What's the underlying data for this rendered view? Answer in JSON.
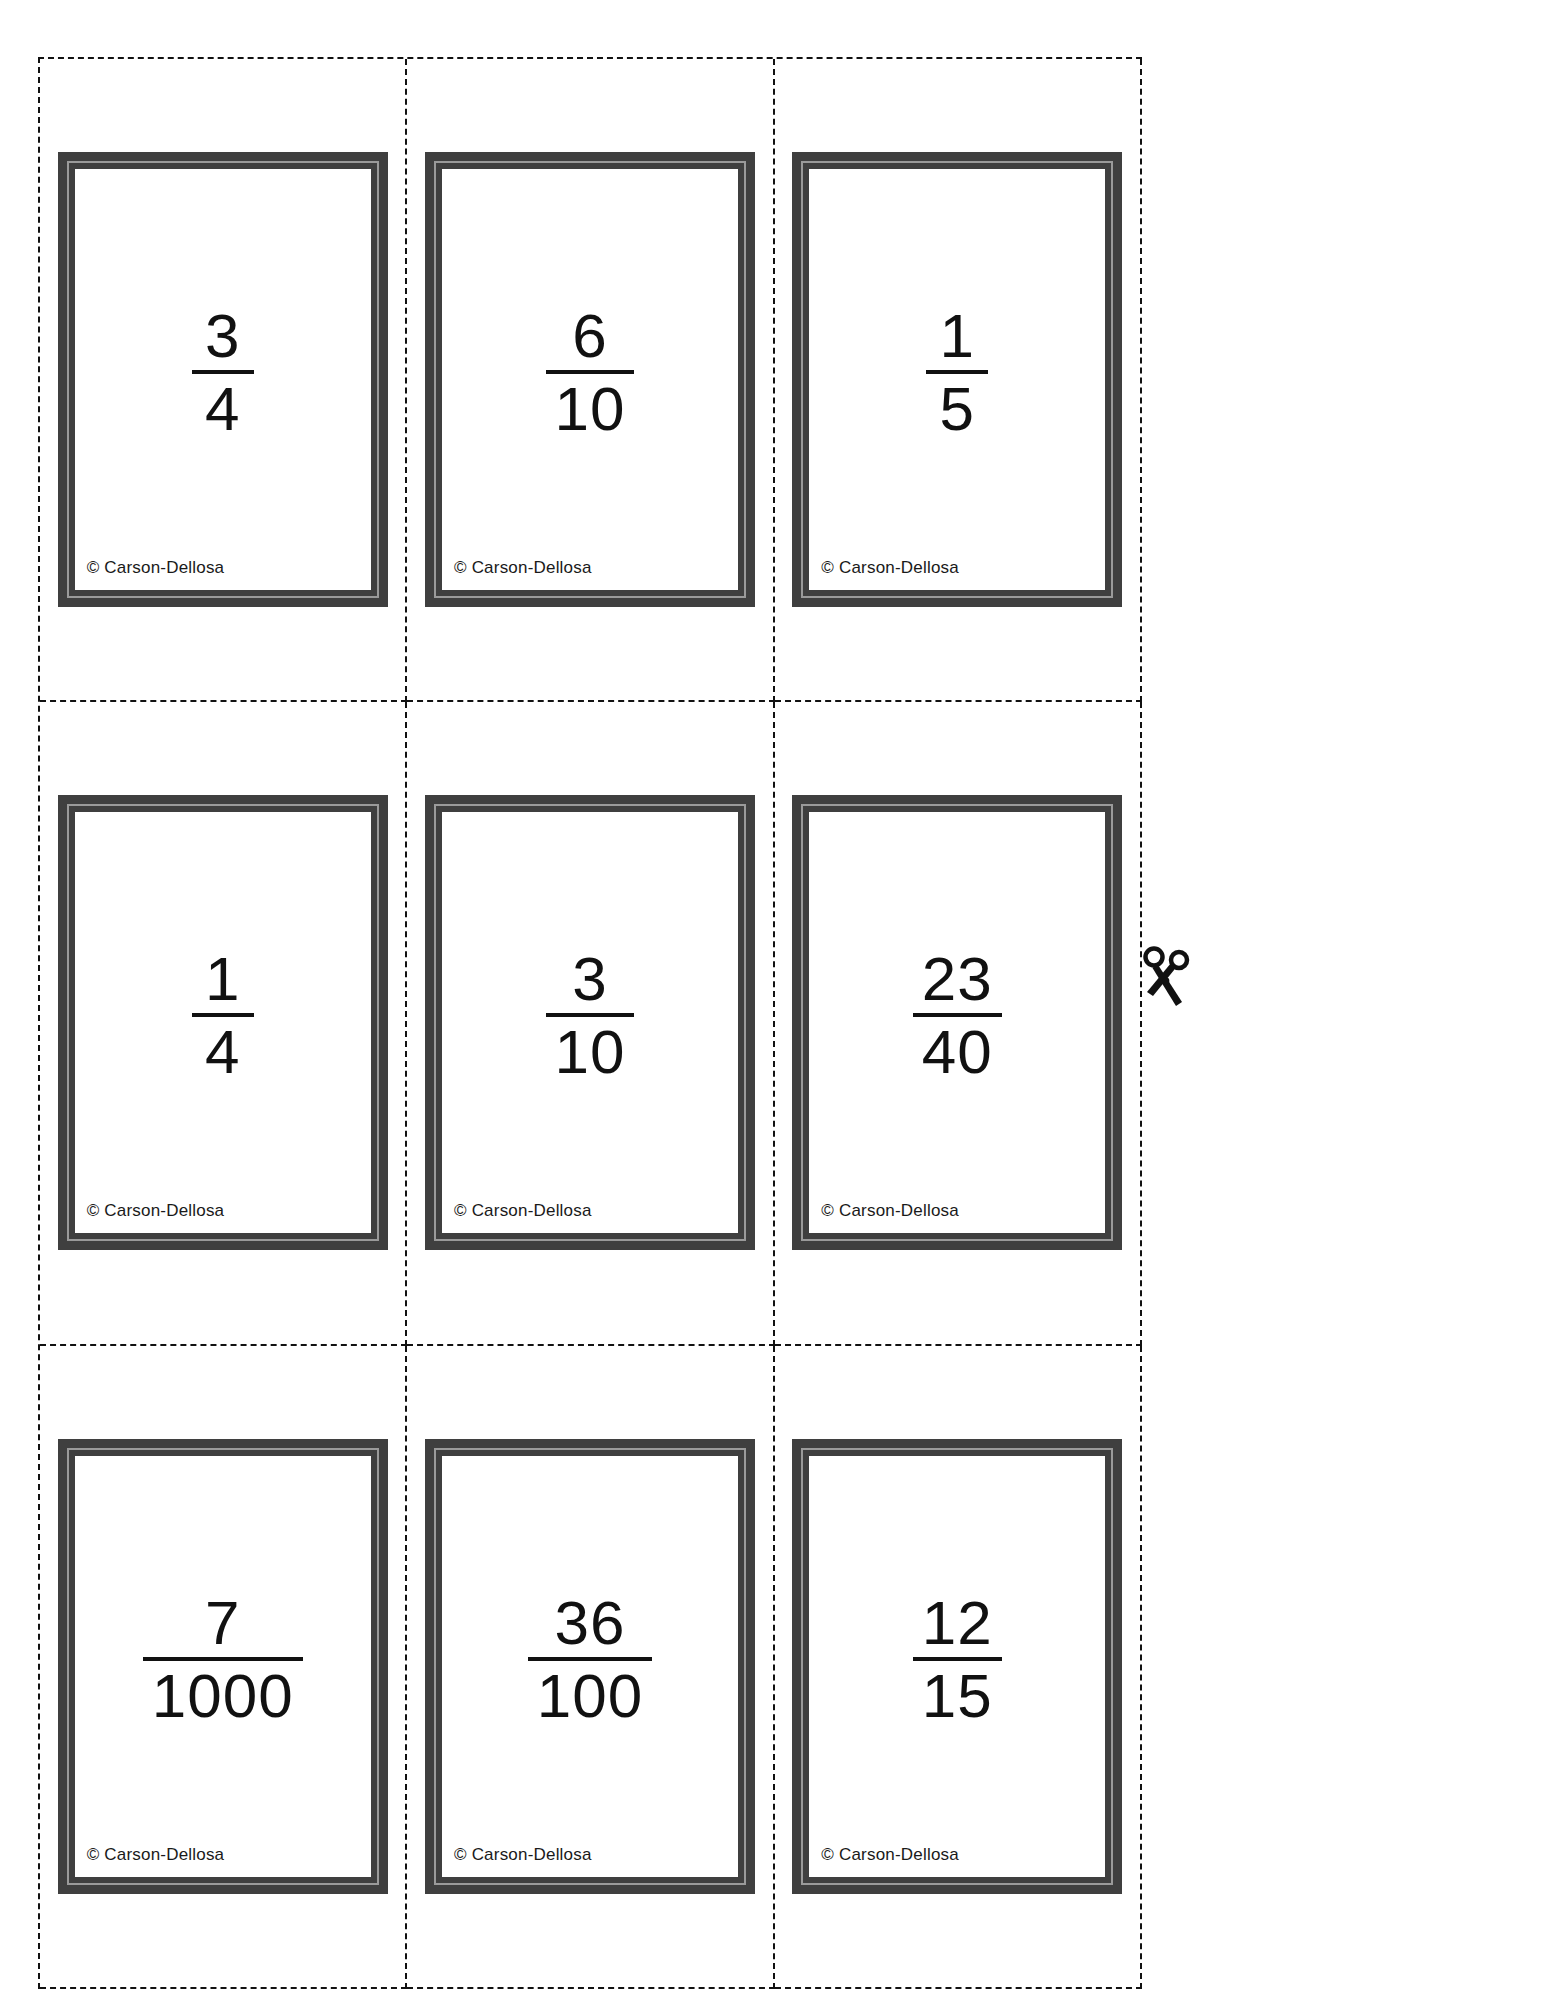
{
  "page": {
    "type": "printable-flash-card-sheet",
    "background_color": "#ffffff",
    "card_border_color": "#3f3f3f",
    "card_inner_border_color": "#9a9a9a",
    "text_color": "#111111",
    "cut_line_style": "dashed",
    "grid_rows": 3,
    "grid_columns": 3
  },
  "copyright_text": "© Carson-Dellosa",
  "icons": {
    "scissors": "scissors-icon"
  },
  "cards": [
    {
      "numerator": "3",
      "denominator": "4",
      "credit": "© Carson-Dellosa"
    },
    {
      "numerator": "6",
      "denominator": "10",
      "credit": "© Carson-Dellosa"
    },
    {
      "numerator": "1",
      "denominator": "5",
      "credit": "© Carson-Dellosa"
    },
    {
      "numerator": "1",
      "denominator": "4",
      "credit": "© Carson-Dellosa"
    },
    {
      "numerator": "3",
      "denominator": "10",
      "credit": "© Carson-Dellosa"
    },
    {
      "numerator": "23",
      "denominator": "40",
      "credit": "© Carson-Dellosa"
    },
    {
      "numerator": "7",
      "denominator": "1000",
      "credit": "© Carson-Dellosa"
    },
    {
      "numerator": "36",
      "denominator": "100",
      "credit": "© Carson-Dellosa"
    },
    {
      "numerator": "12",
      "denominator": "15",
      "credit": "© Carson-Dellosa"
    }
  ]
}
